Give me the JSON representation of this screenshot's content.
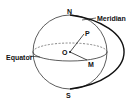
{
  "diagram": {
    "labels": {
      "north": "N",
      "south": "S",
      "point_p": "P",
      "center": "O",
      "point_m": "M",
      "meridian": "Meridian",
      "equator": "Equator"
    }
  }
}
